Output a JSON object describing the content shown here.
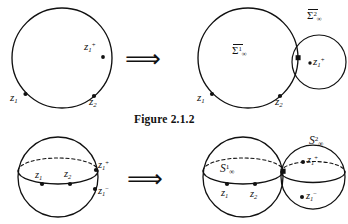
{
  "figure": {
    "caption": "Figure 2.1.2",
    "ink_color": "#111111",
    "background": "#ffffff"
  },
  "top_row": {
    "arrow_glyph": "⟹",
    "left_panel": {
      "name": "single-circle-with-marked-points",
      "shape": "circle",
      "points": [
        {
          "id": "z1plus",
          "label_text": "z",
          "sub": "1",
          "sup": "+"
        },
        {
          "id": "z1",
          "label_text": "z",
          "sub": "1",
          "sup": ""
        },
        {
          "id": "z2",
          "label_text": "z",
          "sub": "2",
          "sup": ""
        }
      ]
    },
    "right_panel": {
      "name": "two-tangent-circles",
      "big_circle_label": {
        "base": "Σ",
        "sup": "1",
        "sub": "∞",
        "overbar": true
      },
      "small_circle_label": {
        "base": "Σ",
        "sup": "2",
        "sub": "∞",
        "overbar": true
      },
      "points": [
        {
          "id": "z1",
          "label_text": "z",
          "sub": "1",
          "sup": ""
        },
        {
          "id": "z2",
          "label_text": "z",
          "sub": "2",
          "sup": ""
        },
        {
          "id": "z1plus",
          "label_text": "z",
          "sub": "1",
          "sup": "+"
        }
      ]
    }
  },
  "bottom_row": {
    "arrow_glyph": "⟹",
    "left_panel": {
      "name": "single-sphere-with-marked-points",
      "shape": "sphere",
      "points": [
        {
          "id": "z1plus",
          "label_text": "z",
          "sub": "1",
          "sup": "+"
        },
        {
          "id": "z1minus",
          "label_text": "z",
          "sub": "1",
          "sup": "−"
        },
        {
          "id": "z1",
          "label_text": "z",
          "sub": "1",
          "sup": ""
        },
        {
          "id": "z2",
          "label_text": "z",
          "sub": "2",
          "sup": ""
        }
      ]
    },
    "right_panel": {
      "name": "two-tangent-spheres",
      "left_sphere_label": {
        "base": "S",
        "sup": "1",
        "sub": "∞",
        "overbar": false
      },
      "right_sphere_label": {
        "base": "S",
        "sup": "2",
        "sub": "∞",
        "overbar": false
      },
      "points": [
        {
          "id": "z1",
          "label_text": "z",
          "sub": "1",
          "sup": ""
        },
        {
          "id": "z2",
          "label_text": "z",
          "sub": "2",
          "sup": ""
        },
        {
          "id": "z1plus",
          "label_text": "z",
          "sub": "1",
          "sup": "+"
        },
        {
          "id": "z1minus",
          "label_text": "z",
          "sub": "1",
          "sup": "−"
        }
      ]
    }
  }
}
